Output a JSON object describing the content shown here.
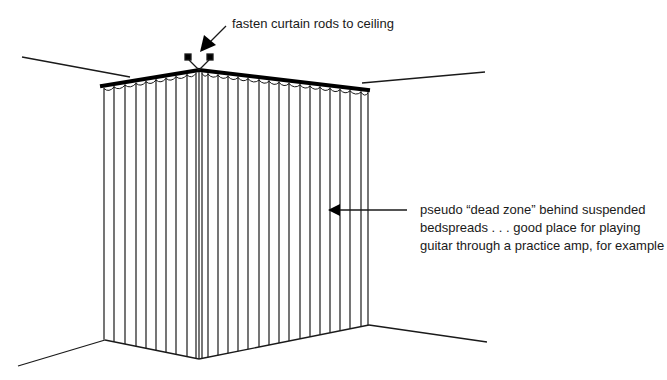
{
  "diagram": {
    "type": "illustration",
    "annotations": {
      "top": "fasten curtain rods to ceiling",
      "side_lines": [
        "pseudo “dead zone” behind suspended",
        "bedspreads . . . good place for playing",
        "guitar through a practice amp, for example"
      ]
    },
    "colors": {
      "ink": "#1a1a1a",
      "background": "#ffffff"
    }
  }
}
